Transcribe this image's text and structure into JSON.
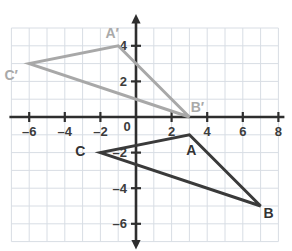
{
  "chart_data": {
    "type": "scatter",
    "title": "",
    "xlabel": "",
    "ylabel": "",
    "xlim": [
      -7.2,
      8.6
    ],
    "ylim": [
      -7.0,
      5.0
    ],
    "grid": true,
    "grid_step": 1,
    "legend": "none",
    "x_ticks": [
      -6,
      -4,
      -2,
      0,
      2,
      4,
      6,
      8
    ],
    "y_ticks": [
      4,
      2,
      -2,
      -4,
      -6
    ],
    "x_tick_labels": [
      "–6",
      "–4",
      "–2",
      "0",
      "2",
      "4",
      "6",
      "8"
    ],
    "y_tick_labels": [
      "4",
      "2",
      "–2",
      "–4",
      "–6"
    ],
    "series": [
      {
        "name": "Triangle ABC",
        "color": "#3a3a3a",
        "closed": true,
        "points": [
          {
            "label": "A",
            "x": 3,
            "y": -1,
            "label_dx": 2,
            "label_dy": 20
          },
          {
            "label": "B",
            "x": 7,
            "y": -5,
            "label_dx": 8,
            "label_dy": 12
          },
          {
            "label": "C",
            "x": -2,
            "y": -2,
            "label_dx": -20,
            "label_dy": 3
          }
        ]
      },
      {
        "name": "Triangle A'B'C'",
        "color": "#a8a8a8",
        "closed": true,
        "points": [
          {
            "label": "A′",
            "x": -1,
            "y": 4,
            "label_dx": -6,
            "label_dy": -8
          },
          {
            "label": "B′",
            "x": 3,
            "y": 0,
            "label_dx": 8,
            "label_dy": -5
          },
          {
            "label": "C′",
            "x": -6,
            "y": 3,
            "label_dx": -18,
            "label_dy": 16
          }
        ]
      }
    ]
  },
  "axes": {
    "x_axis_name": "x-axis",
    "y_axis_name": "y-axis",
    "origin_label": "0",
    "axis_color": "#2e2e2e",
    "grid_color": "#d8dde4"
  }
}
